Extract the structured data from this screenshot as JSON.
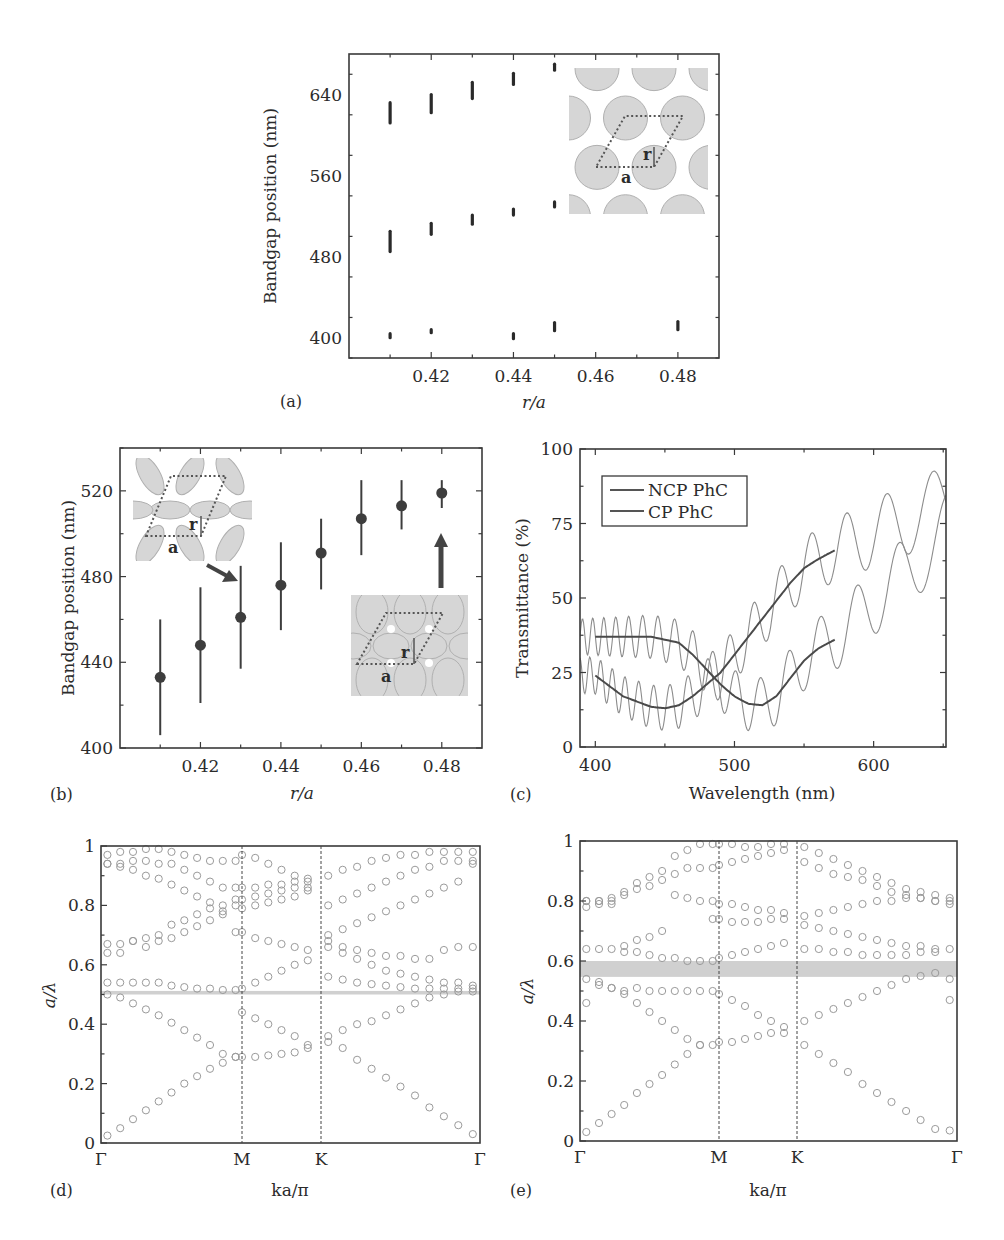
{
  "figure": {
    "panel_labels": [
      "(a)",
      "(b)",
      "(c)",
      "(d)",
      "(e)"
    ],
    "insets": {
      "a": {
        "r_label": "r",
        "a_label": "a",
        "description": "non-close-packed hexagonal lattice of spheres"
      },
      "b_top": {
        "r_label": "r",
        "a_label": "a",
        "description": "overlapping spheres, intermediate r/a"
      },
      "b_bottom": {
        "r_label": "r",
        "a_label": "a",
        "description": "strongly overlapping spheres, r/a = 0.48"
      }
    }
  },
  "chart_data": [
    {
      "id": "a",
      "type": "scatter",
      "title": "",
      "xlabel": "r/a",
      "ylabel": "Bandgap position (nm)",
      "xlim": [
        0.4,
        0.49
      ],
      "ylim": [
        380,
        680
      ],
      "xticks": [
        0.42,
        0.44,
        0.46,
        0.48
      ],
      "xtick_labels": [
        "0.42",
        "0.44",
        "0.46",
        "0.48"
      ],
      "yticks": [
        400,
        480,
        560,
        640
      ],
      "ytick_labels": [
        "400",
        "480",
        "560",
        "640"
      ],
      "grid": false,
      "marker": "vertical bar (bandgap extent)",
      "gaps": [
        {
          "x": 0.41,
          "low": 612,
          "high": 632
        },
        {
          "x": 0.42,
          "low": 622,
          "high": 640
        },
        {
          "x": 0.43,
          "low": 636,
          "high": 652
        },
        {
          "x": 0.44,
          "low": 650,
          "high": 661
        },
        {
          "x": 0.45,
          "low": 664,
          "high": 670
        },
        {
          "x": 0.41,
          "low": 485,
          "high": 505
        },
        {
          "x": 0.42,
          "low": 502,
          "high": 513
        },
        {
          "x": 0.43,
          "low": 512,
          "high": 521
        },
        {
          "x": 0.44,
          "low": 521,
          "high": 527
        },
        {
          "x": 0.45,
          "low": 529,
          "high": 534
        },
        {
          "x": 0.41,
          "low": 400,
          "high": 404
        },
        {
          "x": 0.42,
          "low": 405,
          "high": 408
        },
        {
          "x": 0.44,
          "low": 399,
          "high": 404
        },
        {
          "x": 0.45,
          "low": 407,
          "high": 415
        },
        {
          "x": 0.48,
          "low": 408,
          "high": 416
        }
      ]
    },
    {
      "id": "b",
      "type": "scatter",
      "title": "",
      "xlabel": "r/a",
      "ylabel": "Bandgap position (nm)",
      "xlim": [
        0.4,
        0.49
      ],
      "ylim": [
        400,
        540
      ],
      "xticks": [
        0.42,
        0.44,
        0.46,
        0.48
      ],
      "xtick_labels": [
        "0.42",
        "0.44",
        "0.46",
        "0.48"
      ],
      "yticks": [
        400,
        440,
        480,
        520
      ],
      "ytick_labels": [
        "400",
        "440",
        "480",
        "520"
      ],
      "grid": false,
      "x": [
        0.41,
        0.42,
        0.43,
        0.44,
        0.45,
        0.46,
        0.47,
        0.48
      ],
      "y": [
        433,
        448,
        461,
        476,
        491,
        507,
        513,
        519
      ],
      "yerr_low": [
        406,
        421,
        437,
        455,
        474,
        490,
        502,
        512
      ],
      "yerr_high": [
        460,
        475,
        485,
        496,
        507,
        525,
        525,
        525
      ]
    },
    {
      "id": "c",
      "type": "line",
      "title": "",
      "xlabel": "Wavelength (nm)",
      "ylabel": "Transmittance (%)",
      "xlim": [
        389,
        652
      ],
      "ylim": [
        0,
        100
      ],
      "xticks": [
        400,
        500,
        600
      ],
      "xtick_labels": [
        "400",
        "500",
        "600"
      ],
      "yticks": [
        0,
        25,
        50,
        75,
        100
      ],
      "ytick_labels": [
        "0",
        "25",
        "50",
        "75",
        "100"
      ],
      "grid": false,
      "legend": {
        "position": "top-left",
        "entries": [
          "NCP PhC",
          "CP PhC"
        ]
      },
      "series": [
        {
          "name": "NCP PhC",
          "fit_x": [
            400,
            420,
            440,
            460,
            470,
            480,
            490,
            500,
            510,
            520,
            530,
            540,
            550,
            560,
            572
          ],
          "fit_y": [
            37,
            37,
            37,
            35,
            31,
            26,
            21,
            17,
            14.5,
            14,
            17,
            23,
            29,
            33,
            36
          ],
          "raw_note": "oscillating measured spectrum around fit; extends to 652 nm reaching ~75-85%"
        },
        {
          "name": "CP PhC",
          "fit_x": [
            400,
            420,
            440,
            450,
            460,
            470,
            480,
            490,
            500,
            510,
            520,
            530,
            540,
            550,
            560,
            572
          ],
          "fit_y": [
            24,
            17,
            13.5,
            13,
            14,
            17,
            21,
            25,
            31,
            37,
            43,
            49,
            55,
            60,
            63,
            66
          ],
          "raw_note": "oscillating measured spectrum around fit; extends to 652 nm reaching ~80-89%"
        }
      ]
    },
    {
      "id": "d",
      "type": "scatter",
      "title": "",
      "xlabel": "ka/π",
      "ylabel": "a/λ",
      "ylim": [
        0,
        1
      ],
      "xtick_labels": [
        "Γ",
        "M",
        "K",
        "Γ"
      ],
      "yticks": [
        0,
        0.2,
        0.4,
        0.6,
        0.8,
        1
      ],
      "ytick_labels": [
        "0",
        "0.2",
        "0.4",
        "0.6",
        "0.8",
        "1"
      ],
      "grid": false,
      "gap_band": [
        0.5,
        0.512
      ],
      "path_segments": [
        {
          "from": "Γ",
          "to": "M",
          "n": 11
        },
        {
          "from": "M",
          "to": "K",
          "n": 6
        },
        {
          "from": "K",
          "to": "Γ",
          "n": 11
        }
      ],
      "bands": [
        [
          0.025,
          0.05,
          0.08,
          0.11,
          0.14,
          0.17,
          0.2,
          0.225,
          0.25,
          0.27,
          0.29,
          0.29,
          0.29,
          0.295,
          0.3,
          0.305,
          0.32,
          0.34,
          0.32,
          0.28,
          0.25,
          0.22,
          0.19,
          0.16,
          0.12,
          0.09,
          0.06,
          0.03
        ],
        [
          0.5,
          0.49,
          0.47,
          0.45,
          0.43,
          0.405,
          0.38,
          0.355,
          0.33,
          0.3,
          0.29,
          0.44,
          0.42,
          0.4,
          0.38,
          0.36,
          0.33,
          0.36,
          0.38,
          0.4,
          0.41,
          0.43,
          0.45,
          0.47,
          0.49,
          0.5,
          0.51,
          0.51
        ],
        [
          0.54,
          0.54,
          0.54,
          0.54,
          0.54,
          0.53,
          0.525,
          0.52,
          0.52,
          0.515,
          0.515,
          0.52,
          0.54,
          0.56,
          0.58,
          0.6,
          0.615,
          0.56,
          0.55,
          0.54,
          0.535,
          0.53,
          0.525,
          0.52,
          0.52,
          0.52,
          0.52,
          0.52
        ],
        [
          0.64,
          0.64,
          0.68,
          0.69,
          0.7,
          0.735,
          0.75,
          0.77,
          0.79,
          0.8,
          0.8,
          0.82,
          0.83,
          0.84,
          0.85,
          0.86,
          0.86,
          0.66,
          0.64,
          0.62,
          0.6,
          0.58,
          0.57,
          0.56,
          0.55,
          0.54,
          0.54,
          0.53
        ],
        [
          0.67,
          0.67,
          0.68,
          0.66,
          0.68,
          0.69,
          0.71,
          0.73,
          0.75,
          0.77,
          0.82,
          0.86,
          0.86,
          0.87,
          0.87,
          0.88,
          0.89,
          0.68,
          0.66,
          0.65,
          0.64,
          0.63,
          0.63,
          0.62,
          0.62,
          0.65,
          0.66,
          0.66
        ],
        [
          0.94,
          0.93,
          0.92,
          0.9,
          0.89,
          0.87,
          0.85,
          0.83,
          0.81,
          0.78,
          0.71,
          0.71,
          0.69,
          0.68,
          0.67,
          0.66,
          0.65,
          0.7,
          0.72,
          0.74,
          0.76,
          0.78,
          0.8,
          0.82,
          0.84,
          0.86,
          0.88,
          0.94
        ],
        [
          0.94,
          0.94,
          0.95,
          0.95,
          0.94,
          0.94,
          0.92,
          0.9,
          0.88,
          0.86,
          0.86,
          0.79,
          0.8,
          0.81,
          0.82,
          0.83,
          0.85,
          0.8,
          0.82,
          0.84,
          0.86,
          0.88,
          0.9,
          0.92,
          0.93,
          0.95,
          0.95,
          0.95
        ],
        [
          0.97,
          0.98,
          0.98,
          0.99,
          0.99,
          0.98,
          0.97,
          0.96,
          0.95,
          0.95,
          0.95,
          0.97,
          0.96,
          0.94,
          0.92,
          0.9,
          0.88,
          0.9,
          0.92,
          0.93,
          0.95,
          0.96,
          0.97,
          0.97,
          0.98,
          0.98,
          0.98,
          0.98
        ]
      ]
    },
    {
      "id": "e",
      "type": "scatter",
      "title": "",
      "xlabel": "ka/π",
      "ylabel": "a/λ",
      "ylim": [
        0,
        1
      ],
      "xtick_labels": [
        "Γ",
        "M",
        "K",
        "Γ"
      ],
      "yticks": [
        0,
        0.2,
        0.4,
        0.6,
        0.8,
        1
      ],
      "ytick_labels": [
        "0",
        "0.2",
        "0.4",
        "0.6",
        "0.8",
        "1"
      ],
      "grid": false,
      "gap_band": [
        0.547,
        0.6
      ],
      "path_segments": [
        {
          "from": "Γ",
          "to": "M",
          "n": 11
        },
        {
          "from": "M",
          "to": "K",
          "n": 6
        },
        {
          "from": "K",
          "to": "Γ",
          "n": 11
        }
      ],
      "bands": [
        [
          0.03,
          0.06,
          0.09,
          0.12,
          0.16,
          0.19,
          0.22,
          0.255,
          0.29,
          0.32,
          0.32,
          0.33,
          0.33,
          0.34,
          0.35,
          0.36,
          0.36,
          0.32,
          0.29,
          0.26,
          0.23,
          0.19,
          0.16,
          0.13,
          0.1,
          0.07,
          0.04,
          0.035
        ],
        [
          0.46,
          0.52,
          0.51,
          0.49,
          0.46,
          0.43,
          0.4,
          0.37,
          0.34,
          0.32,
          0.5,
          0.49,
          0.47,
          0.45,
          0.42,
          0.4,
          0.38,
          0.4,
          0.42,
          0.44,
          0.46,
          0.48,
          0.5,
          0.52,
          0.54,
          0.55,
          0.56,
          0.47
        ],
        [
          0.54,
          0.53,
          0.51,
          0.5,
          0.51,
          0.5,
          0.5,
          0.5,
          0.5,
          0.5,
          0.6,
          0.61,
          0.62,
          0.63,
          0.64,
          0.65,
          0.66,
          0.64,
          0.64,
          0.63,
          0.63,
          0.62,
          0.62,
          0.62,
          0.62,
          0.63,
          0.63,
          0.54
        ],
        [
          0.64,
          0.64,
          0.64,
          0.63,
          0.63,
          0.62,
          0.61,
          0.61,
          0.6,
          0.6,
          0.74,
          0.74,
          0.73,
          0.73,
          0.73,
          0.74,
          0.74,
          0.72,
          0.71,
          0.7,
          0.69,
          0.68,
          0.67,
          0.66,
          0.65,
          0.65,
          0.64,
          0.64
        ],
        [
          0.78,
          0.79,
          0.8,
          0.65,
          0.67,
          0.68,
          0.7,
          0.82,
          0.81,
          0.8,
          0.8,
          0.79,
          0.79,
          0.78,
          0.77,
          0.77,
          0.76,
          0.75,
          0.76,
          0.77,
          0.78,
          0.79,
          0.8,
          0.8,
          0.81,
          0.81,
          0.8,
          0.79
        ],
        [
          0.8,
          0.8,
          0.81,
          0.82,
          0.84,
          0.85,
          0.87,
          0.89,
          0.91,
          0.91,
          0.91,
          0.92,
          0.93,
          0.94,
          0.95,
          0.96,
          0.97,
          0.93,
          0.91,
          0.89,
          0.88,
          0.87,
          0.85,
          0.83,
          0.82,
          0.81,
          0.8,
          0.81
        ],
        [
          0.8,
          0.8,
          0.79,
          0.83,
          0.86,
          0.88,
          0.9,
          0.95,
          0.97,
          0.99,
          0.99,
          0.99,
          0.99,
          0.98,
          0.98,
          0.99,
          0.99,
          0.98,
          0.96,
          0.94,
          0.92,
          0.9,
          0.88,
          0.86,
          0.84,
          0.83,
          0.82,
          0.8
        ]
      ]
    }
  ]
}
